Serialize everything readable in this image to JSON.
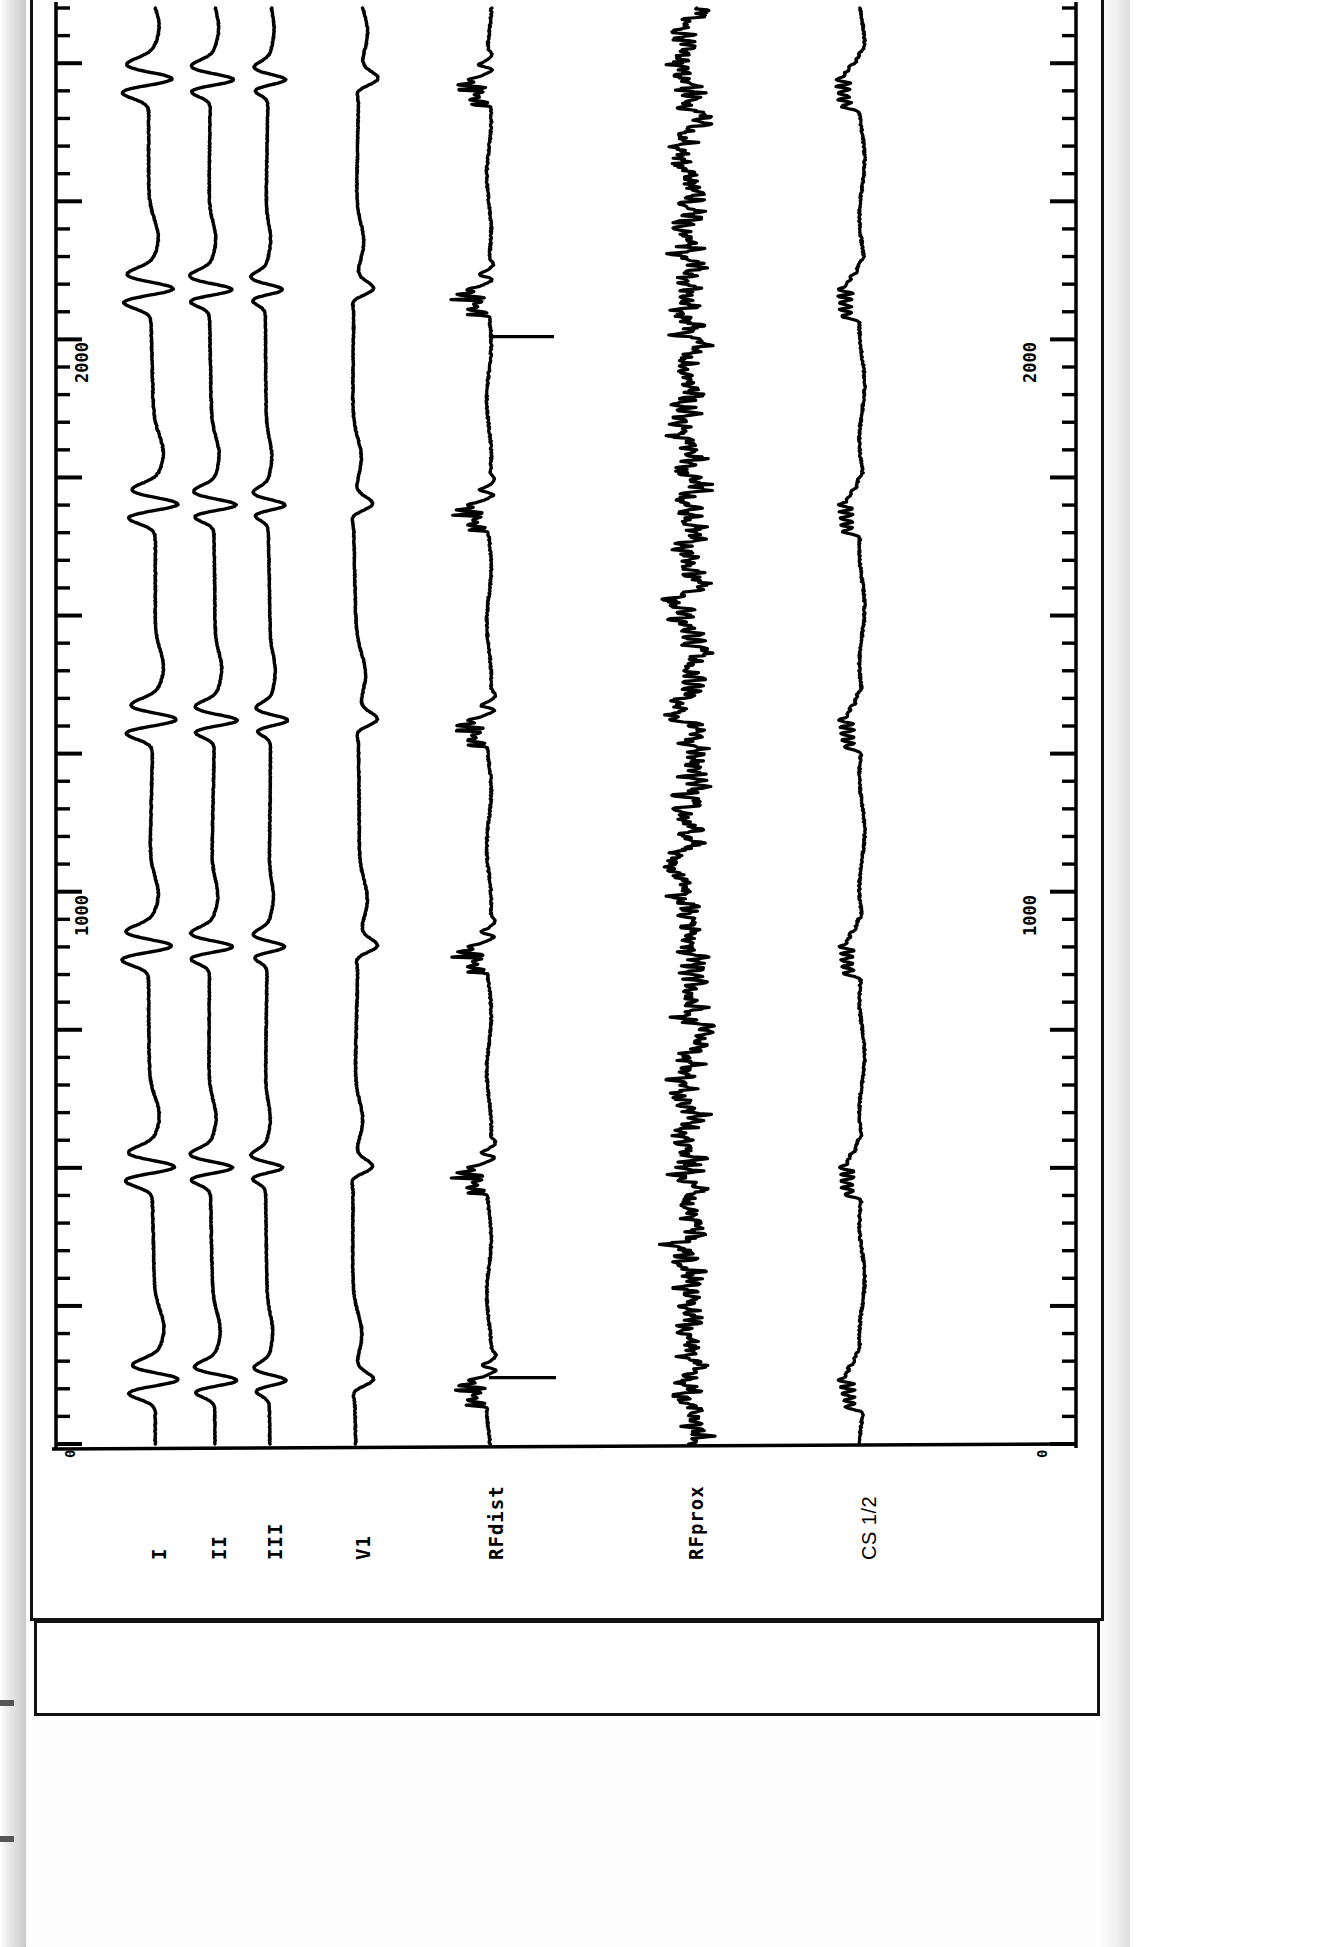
{
  "document": {
    "kind": "electrophysiology-recording-strip",
    "orientation": "rotated-90",
    "background_color": "#ffffff",
    "trace_color": "#000000"
  },
  "axes": {
    "left_ruler": {
      "name": "time-ruler-left",
      "unit": "ms",
      "tick_labels": [
        "0",
        "1000",
        "2000"
      ],
      "tick_values": [
        0,
        1000,
        2000
      ],
      "minor_tick_interval": 50,
      "major_tick_interval": 250
    },
    "right_ruler": {
      "name": "time-ruler-right",
      "unit": "ms",
      "tick_labels": [
        "0",
        "1000",
        "2000"
      ],
      "tick_values": [
        0,
        1000,
        2000
      ],
      "minor_tick_interval": 50,
      "major_tick_interval": 250
    }
  },
  "channels": [
    {
      "id": "ch-I",
      "label": "I",
      "type": "surface-ecg",
      "style": "mono"
    },
    {
      "id": "ch-II",
      "label": "II",
      "type": "surface-ecg",
      "style": "mono"
    },
    {
      "id": "ch-III",
      "label": "III",
      "type": "surface-ecg",
      "style": "mono"
    },
    {
      "id": "ch-V1",
      "label": "V1",
      "type": "surface-ecg",
      "style": "mono"
    },
    {
      "id": "ch-RFdist",
      "label": "RFdist",
      "type": "intracardiac",
      "style": "mono"
    },
    {
      "id": "ch-RFprox",
      "label": "RFprox",
      "type": "intracardiac",
      "style": "mono"
    },
    {
      "id": "ch-CS12",
      "label": "CS 1/2",
      "type": "intracardiac",
      "style": "plain"
    }
  ],
  "chart_data": {
    "type": "line",
    "title": "",
    "xlabel": "",
    "ylabel": "",
    "xlim": [
      0,
      2600
    ],
    "grid": false,
    "legend": "none",
    "beat_times_ms": [
      115,
      500,
      900,
      1310,
      1700,
      2090,
      2470
    ],
    "series": [
      {
        "name": "I",
        "baseline_px": 118,
        "amplitude_px": 30
      },
      {
        "name": "II",
        "baseline_px": 178,
        "amplitude_px": 26
      },
      {
        "name": "III",
        "baseline_px": 234,
        "amplitude_px": 22
      },
      {
        "name": "V1",
        "baseline_px": 322,
        "amplitude_px": 24
      },
      {
        "name": "RFdist",
        "baseline_px": 455,
        "amplitude_px": 44
      },
      {
        "name": "RFprox",
        "baseline_px": 655,
        "amplitude_px": 34
      },
      {
        "name": "CS 1/2",
        "baseline_px": 828,
        "amplitude_px": 48
      }
    ]
  }
}
